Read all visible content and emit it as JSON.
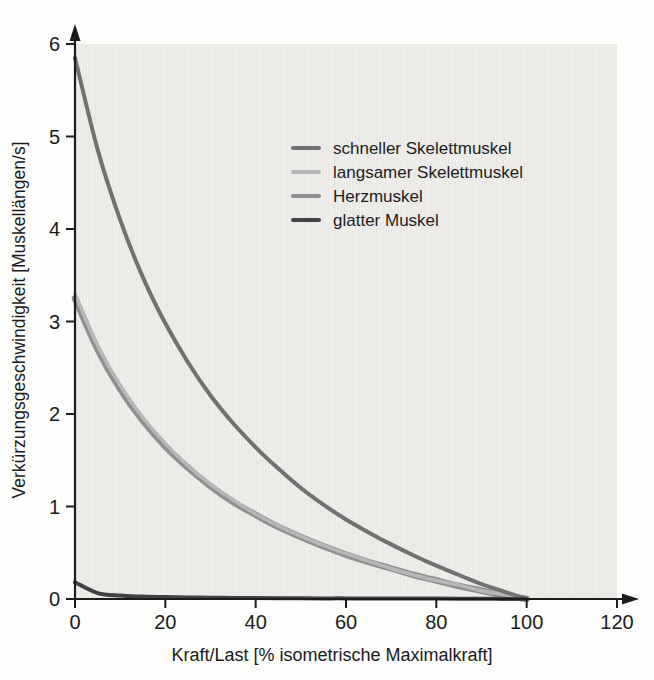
{
  "chart_data": {
    "type": "line",
    "title": "",
    "xlabel": "Kraft/Last [% isometrische Maximalkraft]",
    "ylabel": "Verkürzungsgeschwindigkeit [Muskellängen/s]",
    "xlim": [
      0,
      120
    ],
    "ylim": [
      0,
      6
    ],
    "x_ticks": [
      0,
      20,
      40,
      60,
      80,
      100,
      120
    ],
    "y_ticks": [
      0,
      1,
      2,
      3,
      4,
      5,
      6
    ],
    "grid": false,
    "legend_position": "inside-upper-right",
    "plot_background": "#eae9e6",
    "axis_color": "#1c1c1c",
    "x": [
      0,
      5,
      10,
      15,
      20,
      25,
      30,
      35,
      40,
      45,
      50,
      55,
      60,
      65,
      70,
      75,
      80,
      85,
      90,
      95,
      100
    ],
    "series": [
      {
        "name": "schneller Skelettmuskel",
        "color": "#717171",
        "width": 4,
        "values": [
          5.85,
          4.86,
          4.1,
          3.48,
          2.98,
          2.56,
          2.2,
          1.9,
          1.64,
          1.41,
          1.2,
          1.02,
          0.86,
          0.72,
          0.59,
          0.47,
          0.36,
          0.26,
          0.16,
          0.08,
          0
        ]
      },
      {
        "name": "langsamer Skelettmuskel",
        "color": "#b7b7b7",
        "width": 3.5,
        "values": [
          3.3,
          2.74,
          2.31,
          1.96,
          1.68,
          1.44,
          1.24,
          1.07,
          0.92,
          0.79,
          0.68,
          0.58,
          0.49,
          0.41,
          0.33,
          0.26,
          0.2,
          0.15,
          0.09,
          0.05,
          0
        ]
      },
      {
        "name": "Herzmuskel",
        "color": "#8f8f8f",
        "width": 6.5,
        "values": [
          3.25,
          2.7,
          2.27,
          1.93,
          1.65,
          1.42,
          1.22,
          1.05,
          0.91,
          0.78,
          0.67,
          0.57,
          0.48,
          0.4,
          0.33,
          0.26,
          0.2,
          0.14,
          0.09,
          0.04,
          0
        ]
      },
      {
        "name": "glatter Muskel",
        "color": "#424242",
        "width": 4,
        "values": [
          0.18,
          0.064,
          0.037,
          0.026,
          0.02,
          0.016,
          0.014,
          0.012,
          0.01,
          0.009,
          0.008,
          0.007,
          0.007,
          0.006,
          0.005,
          0.005,
          0.004,
          0.003,
          0.002,
          0.001,
          0
        ]
      }
    ],
    "draw_order": [
      2,
      1,
      0,
      3
    ]
  }
}
